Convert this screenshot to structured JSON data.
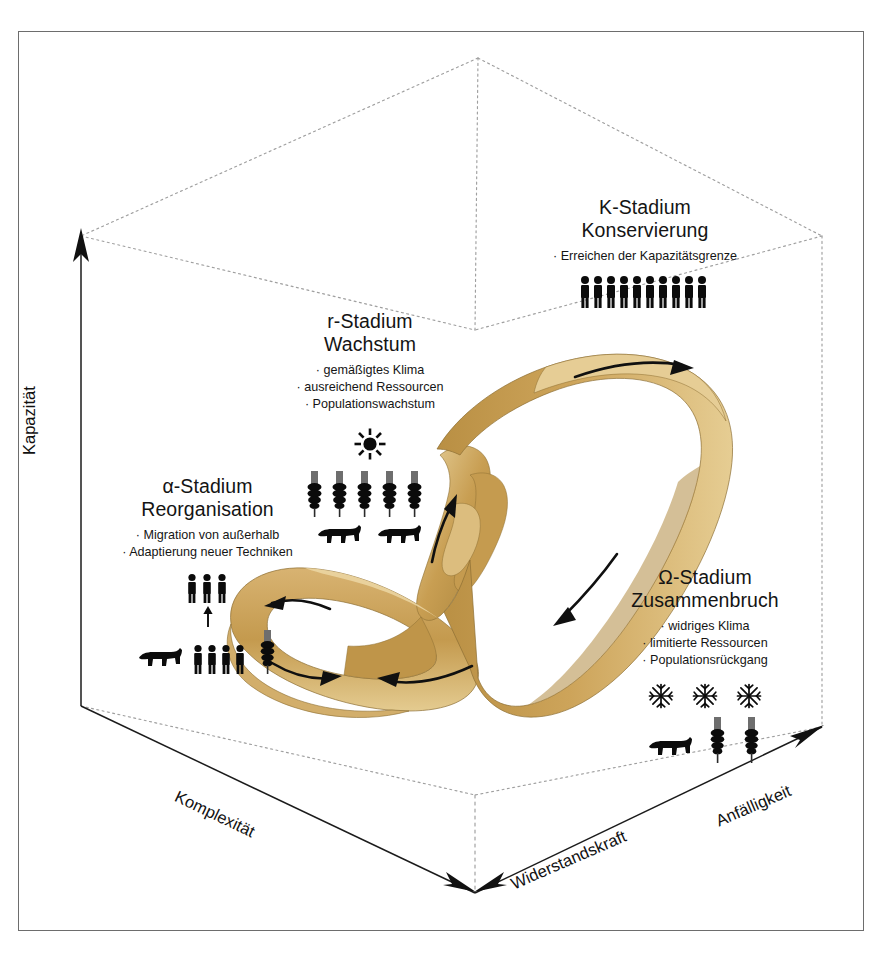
{
  "figure": {
    "type": "adaptive-cycle-diagram",
    "language": "de",
    "background_color": "#ffffff",
    "frame_color": "#6d6d6d",
    "ribbon_color": "#c8a152",
    "ribbon_color_light": "#e3c98c",
    "ribbon_color_dark": "#a9863f",
    "text_color": "#141414"
  },
  "axes": {
    "vertical": {
      "label": "Kapazität",
      "direction": "up",
      "arrow": true
    },
    "left_diagonal": {
      "label": "Komplexität",
      "direction": "down-right",
      "arrow": true
    },
    "bottom_right_diagonal": {
      "label": "Widerstandskraft",
      "direction": "down-left",
      "arrow": true
    },
    "right_diagonal": {
      "label": "Anfälligkeit",
      "direction": "up-right",
      "arrow": true
    }
  },
  "stages": [
    {
      "id": "k",
      "title": "K-Stadium",
      "subtitle": "Konservierung",
      "bullets": [
        "· Erreichen der Kapazitätsgrenze"
      ],
      "icons": [
        {
          "name": "person-icon",
          "count": 10
        }
      ]
    },
    {
      "id": "r",
      "title": "r-Stadium",
      "subtitle": "Wachstum",
      "bullets": [
        "· gemäßigtes Klima",
        "· ausreichend Ressourcen",
        "· Populationswachstum"
      ],
      "icons": [
        {
          "name": "sun-icon",
          "count": 1
        },
        {
          "name": "wheat-icon",
          "count": 5
        },
        {
          "name": "cow-icon",
          "count": 2
        }
      ]
    },
    {
      "id": "alpha",
      "title": "α-Stadium",
      "subtitle": "Reorganisation",
      "bullets": [
        "· Migration von außerhalb",
        "· Adaptierung neuer Techniken"
      ],
      "icons": [
        {
          "name": "person-icon",
          "count": 3,
          "group": "top"
        },
        {
          "name": "up-arrow-icon",
          "count": 1
        },
        {
          "name": "cow-icon",
          "count": 1,
          "group": "bottom"
        },
        {
          "name": "person-icon",
          "count": 4,
          "group": "bottom"
        },
        {
          "name": "wheat-icon",
          "count": 1,
          "group": "bottom"
        }
      ]
    },
    {
      "id": "omega",
      "title": "Ω-Stadium",
      "subtitle": "Zusammenbruch",
      "bullets": [
        "· widriges Klima",
        "· limitierte Ressourcen",
        "· Populationsrückgang"
      ],
      "icons": [
        {
          "name": "snowflake-icon",
          "count": 3
        },
        {
          "name": "cow-icon",
          "count": 1
        },
        {
          "name": "wheat-icon",
          "count": 2
        }
      ]
    }
  ],
  "ribbon": {
    "shape": "mobius-infinity-loop",
    "flow_arrows": [
      {
        "id": "arrow-alpha-upper",
        "direction": "left",
        "stage": "alpha"
      },
      {
        "id": "arrow-alpha-lower",
        "direction": "right",
        "stage": "alpha"
      },
      {
        "id": "arrow-r-ascend",
        "direction": "up",
        "stage": "r"
      },
      {
        "id": "arrow-k-top",
        "direction": "right",
        "stage": "k"
      },
      {
        "id": "arrow-omega-descend",
        "direction": "down-left",
        "stage": "omega"
      },
      {
        "id": "arrow-bottom-return",
        "direction": "left",
        "stage": "omega-to-alpha"
      }
    ]
  },
  "cube": {
    "style": "dotted-wireframe",
    "color": "#9a9a9a"
  }
}
